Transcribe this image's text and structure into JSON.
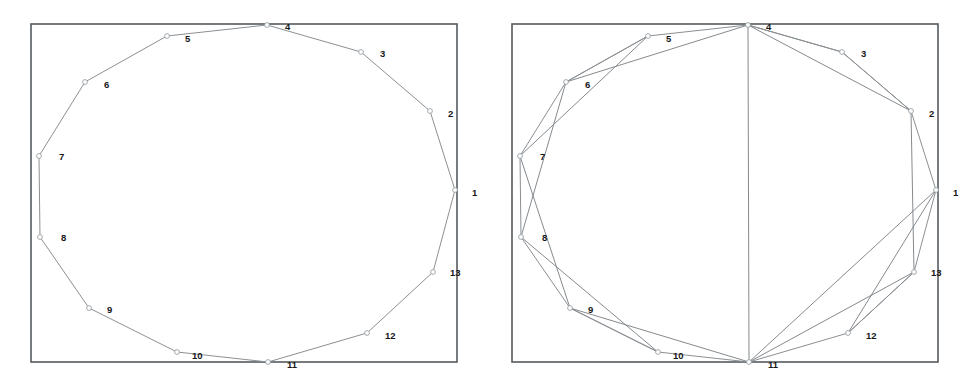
{
  "figure": {
    "panel_count": 2,
    "vertex_count": 13,
    "line_color": "#8b9094",
    "frame_color": "#555b5e",
    "label_color": "#16181a",
    "background": "#ffffff"
  },
  "chart_data": {
    "type": "scatter",
    "title": "",
    "subtitle": "",
    "xlabel": "",
    "ylabel": "",
    "grid": false,
    "legend": null,
    "xlim": [
      0,
      489
    ],
    "ylim": [
      0,
      385
    ],
    "panels": [
      {
        "name": "left-panel",
        "frame": {
          "x": 31,
          "y": 24,
          "width": 426,
          "height": 338
        },
        "edge_set": "cycle-only",
        "points": [
          {
            "id": 1,
            "label": "1",
            "x": 455,
            "y": 190,
            "label_x": 472,
            "label_y": 193
          },
          {
            "id": 2,
            "label": "2",
            "x": 430,
            "y": 111,
            "label_x": 448,
            "label_y": 114
          },
          {
            "id": 3,
            "label": "3",
            "x": 361,
            "y": 52,
            "label_x": 380,
            "label_y": 54
          },
          {
            "id": 4,
            "label": "4",
            "x": 267,
            "y": 25,
            "label_x": 285,
            "label_y": 27
          },
          {
            "id": 5,
            "label": "5",
            "x": 167,
            "y": 36,
            "label_x": 185,
            "label_y": 39
          },
          {
            "id": 6,
            "label": "6",
            "x": 85,
            "y": 82,
            "label_x": 104,
            "label_y": 85
          },
          {
            "id": 7,
            "label": "7",
            "x": 39,
            "y": 156,
            "label_x": 59,
            "label_y": 157
          },
          {
            "id": 8,
            "label": "8",
            "x": 40,
            "y": 237,
            "label_x": 61,
            "label_y": 238
          },
          {
            "id": 9,
            "label": "9",
            "x": 89,
            "y": 308,
            "label_x": 107,
            "label_y": 310
          },
          {
            "id": 10,
            "label": "10",
            "x": 177,
            "y": 352,
            "label_x": 192,
            "label_y": 356
          },
          {
            "id": 11,
            "label": "11",
            "x": 268,
            "y": 362,
            "label_x": 287,
            "label_y": 365
          },
          {
            "id": 12,
            "label": "12",
            "x": 367,
            "y": 333,
            "label_x": 385,
            "label_y": 336
          },
          {
            "id": 13,
            "label": "13",
            "x": 433,
            "y": 272,
            "label_x": 450,
            "label_y": 273
          }
        ],
        "cycle_edges": [
          [
            1,
            2
          ],
          [
            2,
            3
          ],
          [
            3,
            4
          ],
          [
            4,
            5
          ],
          [
            5,
            6
          ],
          [
            6,
            7
          ],
          [
            7,
            8
          ],
          [
            8,
            9
          ],
          [
            9,
            10
          ],
          [
            10,
            11
          ],
          [
            11,
            12
          ],
          [
            12,
            13
          ],
          [
            13,
            1
          ]
        ],
        "chord_edges": []
      },
      {
        "name": "right-panel",
        "frame": {
          "x": 24,
          "y": 24,
          "width": 426,
          "height": 338
        },
        "edge_set": "cycle-plus-chords",
        "points": [
          {
            "id": 1,
            "label": "1",
            "x": 448,
            "y": 190,
            "label_x": 465,
            "label_y": 193
          },
          {
            "id": 2,
            "label": "2",
            "x": 423,
            "y": 111,
            "label_x": 441,
            "label_y": 114
          },
          {
            "id": 3,
            "label": "3",
            "x": 354,
            "y": 52,
            "label_x": 373,
            "label_y": 54
          },
          {
            "id": 4,
            "label": "4",
            "x": 260,
            "y": 25,
            "label_x": 278,
            "label_y": 27
          },
          {
            "id": 5,
            "label": "5",
            "x": 160,
            "y": 36,
            "label_x": 178,
            "label_y": 39
          },
          {
            "id": 6,
            "label": "6",
            "x": 78,
            "y": 82,
            "label_x": 97,
            "label_y": 85
          },
          {
            "id": 7,
            "label": "7",
            "x": 32,
            "y": 156,
            "label_x": 52,
            "label_y": 157
          },
          {
            "id": 8,
            "label": "8",
            "x": 33,
            "y": 237,
            "label_x": 54,
            "label_y": 238
          },
          {
            "id": 9,
            "label": "9",
            "x": 82,
            "y": 308,
            "label_x": 100,
            "label_y": 310
          },
          {
            "id": 10,
            "label": "10",
            "x": 170,
            "y": 352,
            "label_x": 185,
            "label_y": 356
          },
          {
            "id": 11,
            "label": "11",
            "x": 261,
            "y": 362,
            "label_x": 280,
            "label_y": 365
          },
          {
            "id": 12,
            "label": "12",
            "x": 360,
            "y": 333,
            "label_x": 378,
            "label_y": 336
          },
          {
            "id": 13,
            "label": "13",
            "x": 426,
            "y": 272,
            "label_x": 443,
            "label_y": 273
          }
        ],
        "cycle_edges": [
          [
            1,
            2
          ],
          [
            2,
            3
          ],
          [
            3,
            4
          ],
          [
            4,
            5
          ],
          [
            5,
            6
          ],
          [
            6,
            7
          ],
          [
            7,
            8
          ],
          [
            8,
            9
          ],
          [
            9,
            10
          ],
          [
            10,
            11
          ],
          [
            11,
            12
          ],
          [
            12,
            13
          ],
          [
            13,
            1
          ]
        ],
        "chord_edges": [
          [
            4,
            6
          ],
          [
            4,
            3
          ],
          [
            4,
            2
          ],
          [
            4,
            11
          ],
          [
            11,
            9
          ],
          [
            11,
            13
          ],
          [
            11,
            1
          ],
          [
            7,
            5
          ],
          [
            7,
            9
          ],
          [
            8,
            6
          ],
          [
            8,
            10
          ],
          [
            2,
            13
          ],
          [
            13,
            12
          ],
          [
            1,
            12
          ],
          [
            3,
            2
          ],
          [
            5,
            6
          ],
          [
            10,
            9
          ]
        ]
      }
    ]
  }
}
